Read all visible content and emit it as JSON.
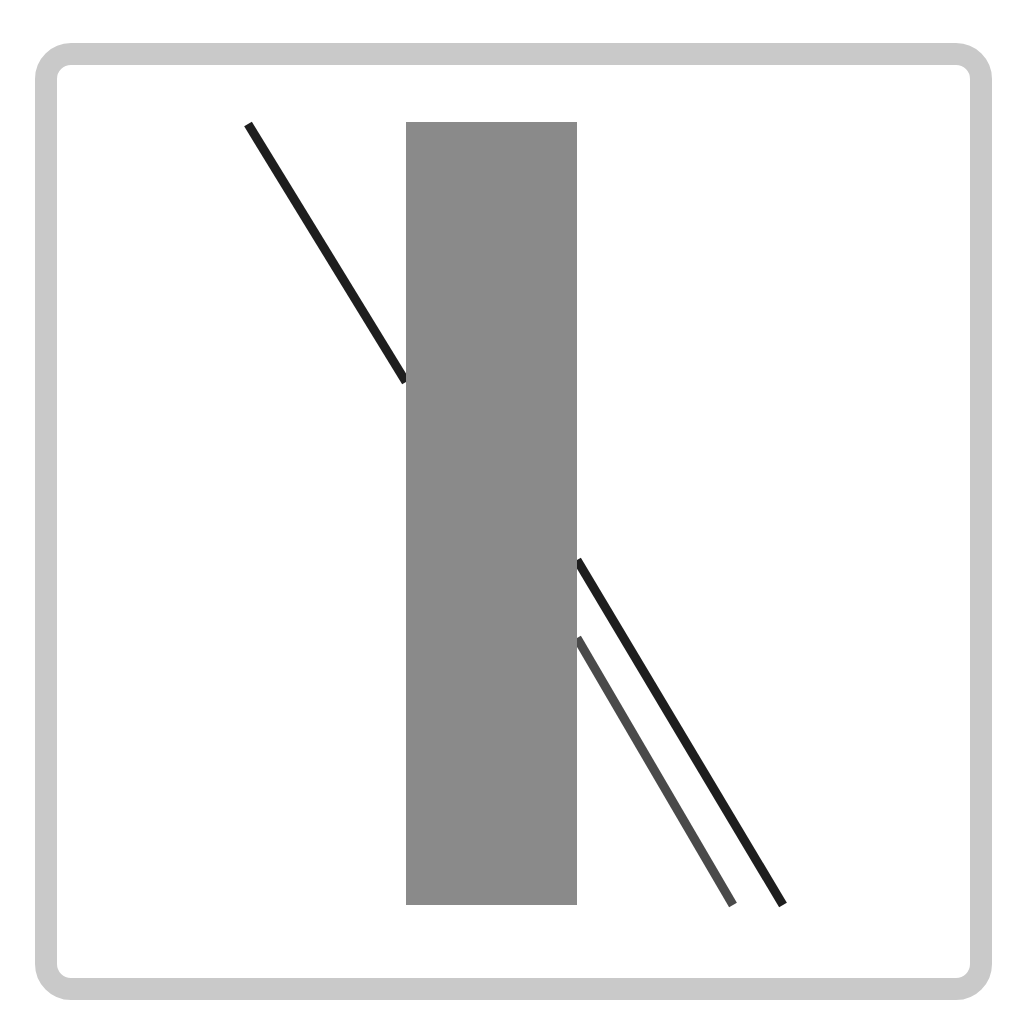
{
  "diagram": {
    "type": "poggendorff-illusion",
    "frame": {
      "color": "#c9c9c9",
      "fill": "#ffffff"
    },
    "occluder": {
      "x": 406,
      "y": 122,
      "width": 171,
      "height": 783,
      "color": "#8a8a8a"
    },
    "lines": [
      {
        "id": "upper-segment",
        "x1": 248,
        "y1": 124,
        "x2": 406,
        "y2": 382,
        "color": "#1e1e1e",
        "width": 9
      },
      {
        "id": "lower-segment-continuous",
        "x1": 577,
        "y1": 560,
        "x2": 783,
        "y2": 905,
        "color": "#1e1e1e",
        "width": 9
      },
      {
        "id": "lower-segment-distractor",
        "x1": 577,
        "y1": 638,
        "x2": 733,
        "y2": 905,
        "color": "#4a4a4a",
        "width": 9
      }
    ]
  }
}
